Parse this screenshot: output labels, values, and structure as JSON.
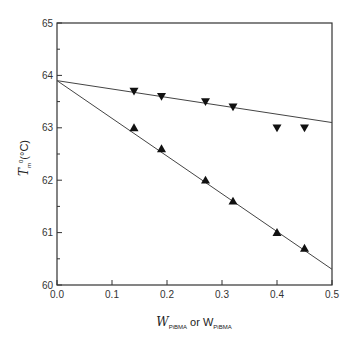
{
  "chart_data": {
    "type": "scatter",
    "title": "",
    "xlabel": "W_PiBMA or W_PiBMA",
    "ylabel": "T_m^0(°C)",
    "xlim": [
      0.0,
      0.5
    ],
    "ylim": [
      60,
      65
    ],
    "x_ticks": [
      "0.0",
      "0.1",
      "0.2",
      "0.3",
      "0.4",
      "0.5"
    ],
    "y_ticks": [
      "60",
      "61",
      "62",
      "63",
      "64",
      "65"
    ],
    "grid": false,
    "legend": null,
    "series": [
      {
        "name": "down-triangle series",
        "marker": "triangle-down",
        "color": "#111111",
        "x": [
          0.14,
          0.19,
          0.27,
          0.32,
          0.4,
          0.45
        ],
        "y": [
          63.7,
          63.6,
          63.5,
          63.4,
          63.0,
          63.0
        ],
        "fit_line": {
          "x": [
            0.0,
            0.5
          ],
          "y": [
            63.9,
            63.1
          ]
        }
      },
      {
        "name": "up-triangle series",
        "marker": "triangle-up",
        "color": "#111111",
        "x": [
          0.14,
          0.19,
          0.27,
          0.32,
          0.4,
          0.45
        ],
        "y": [
          63.0,
          62.6,
          62.0,
          61.6,
          61.0,
          60.7
        ],
        "fit_line": {
          "x": [
            0.0,
            0.5
          ],
          "y": [
            63.9,
            60.3
          ]
        }
      }
    ]
  },
  "labels": {
    "x_title_main_1": "W",
    "x_title_sub_1": "PiBMA",
    "x_title_or": " or ",
    "x_title_main_2": "W",
    "x_title_sub_2": "PiBMA",
    "y_title_main": "T",
    "y_title_sub": "m",
    "y_title_sup": "0",
    "y_title_unit": "(°C)"
  }
}
